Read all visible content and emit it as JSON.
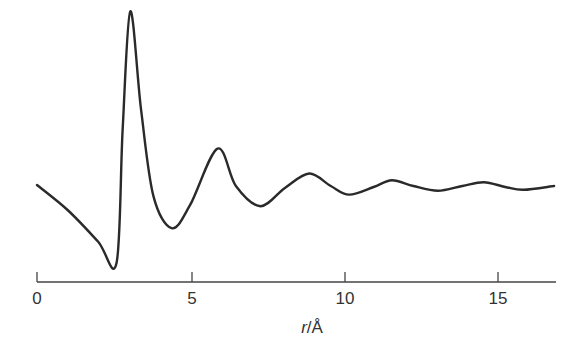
{
  "chart_data": {
    "type": "line",
    "title": "",
    "xlabel": "r/Å",
    "ylabel": "",
    "xlim": [
      0,
      17
    ],
    "x_ticks": [
      0,
      5,
      10,
      15
    ],
    "x_tick_labels": [
      "0",
      "5",
      "10",
      "15"
    ],
    "grid": false,
    "legend": null,
    "series": [
      {
        "name": "g(r)",
        "x": [
          0,
          1.0,
          2.0,
          2.6,
          2.8,
          3.05,
          3.4,
          3.8,
          4.4,
          5.0,
          5.9,
          6.5,
          7.3,
          8.1,
          8.9,
          9.6,
          10.2,
          11.0,
          11.6,
          12.3,
          13.1,
          13.9,
          14.6,
          15.3,
          15.9,
          16.9
        ],
        "y": [
          1.01,
          0.75,
          0.42,
          0.2,
          1.6,
          2.82,
          1.8,
          0.9,
          0.56,
          0.8,
          1.39,
          1.0,
          0.79,
          0.98,
          1.13,
          1.0,
          0.91,
          0.99,
          1.06,
          1.0,
          0.95,
          1.0,
          1.04,
          0.99,
          0.96,
          1.0
        ]
      }
    ]
  },
  "axis": {
    "ticks": [
      "0",
      "5",
      "10",
      "15"
    ],
    "label_var": "r",
    "label_unit": "/Å"
  }
}
